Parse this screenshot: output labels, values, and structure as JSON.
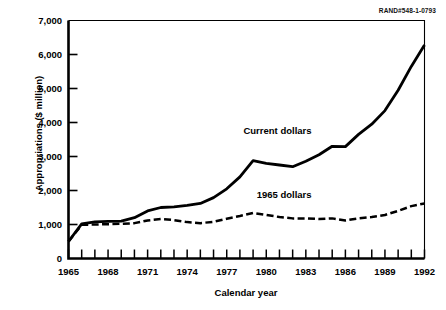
{
  "figure": {
    "rand_id": "RAND#548-1-0793"
  },
  "chart_data": {
    "type": "line",
    "title": "",
    "xlabel": "Calendar year",
    "ylabel": "Appropriations ($ million)",
    "xlim": [
      1965,
      1992
    ],
    "ylim": [
      0,
      7000
    ],
    "grid": false,
    "legend_position": "inline-annotation",
    "x_tick_labels": [
      "1965",
      "1968",
      "1971",
      "1974",
      "1977",
      "1980",
      "1983",
      "1986",
      "1989",
      "1992"
    ],
    "x_tick_values": [
      1965,
      1968,
      1971,
      1974,
      1977,
      1980,
      1983,
      1986,
      1989,
      1992
    ],
    "x_minor_ticks_every": 1,
    "y_tick_labels": [
      "0",
      "1,000",
      "2,000",
      "3,000",
      "4,000",
      "5,000",
      "6,000",
      "7,000"
    ],
    "y_tick_values": [
      0,
      1000,
      2000,
      3000,
      4000,
      5000,
      6000,
      7000
    ],
    "x": [
      1965,
      1966,
      1967,
      1968,
      1969,
      1970,
      1971,
      1972,
      1973,
      1974,
      1975,
      1976,
      1977,
      1978,
      1979,
      1980,
      1981,
      1982,
      1983,
      1984,
      1985,
      1986,
      1987,
      1988,
      1989,
      1990,
      1991,
      1992
    ],
    "series": [
      {
        "name": "Current dollars",
        "style": "solid",
        "color": "#000000",
        "values": [
          500,
          1020,
          1080,
          1090,
          1100,
          1200,
          1400,
          1500,
          1520,
          1560,
          1620,
          1790,
          2050,
          2400,
          2880,
          2800,
          2750,
          2700,
          2860,
          3050,
          3300,
          3290,
          3650,
          3950,
          4350,
          4950,
          5650,
          6280
        ]
      },
      {
        "name": "1965 dollars",
        "style": "dashed",
        "color": "#000000",
        "values": [
          500,
          990,
          1000,
          1010,
          1020,
          1040,
          1120,
          1160,
          1130,
          1070,
          1040,
          1080,
          1170,
          1250,
          1340,
          1280,
          1220,
          1180,
          1180,
          1160,
          1180,
          1120,
          1180,
          1220,
          1280,
          1400,
          1540,
          1620
        ]
      }
    ],
    "annotations": [
      {
        "text": "Current dollars",
        "x": 1981.0,
        "y": 3750
      },
      {
        "text": "1965 dollars",
        "x": 1982.0,
        "y": 1880
      }
    ]
  }
}
